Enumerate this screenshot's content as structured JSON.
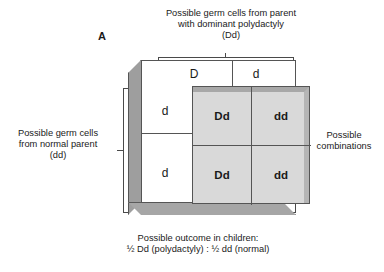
{
  "figure": {
    "panel_label": "A",
    "top_caption": "Possible germ cells from parent\nwith dominant polydactyly\n(Dd)",
    "left_caption": "Possible germ cells\nfrom normal parent\n(dd)",
    "right_caption": "Possible\ncombinations",
    "bottom_caption": "Possible outcome in children:\n½ Dd (polydactyly)  :  ½ dd (normal)"
  },
  "punnett": {
    "column_headers": [
      "D",
      "d"
    ],
    "row_headers": [
      "d",
      "d"
    ],
    "cells": [
      [
        "Dd",
        "dd"
      ],
      [
        "Dd",
        "dd"
      ]
    ]
  },
  "colors": {
    "grid_fill": "#d9d9d9",
    "box_side": "#9e9e9e",
    "box_bottom": "#a6a6a6",
    "line": "#555555",
    "text": "#1a1a1a"
  }
}
